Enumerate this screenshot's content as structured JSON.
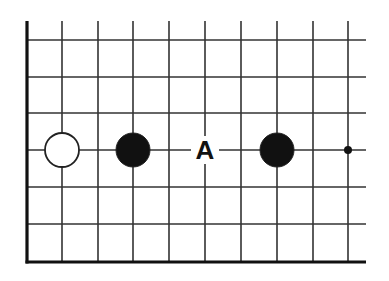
{
  "diagram": {
    "type": "go-board-fragment",
    "grid": {
      "x": [
        27,
        62,
        98,
        133,
        169,
        205,
        241,
        277,
        313,
        348
      ],
      "y": [
        40,
        77,
        113,
        150,
        187,
        224,
        262
      ],
      "top_open_y": 21,
      "right_open_x": 366,
      "edge_left_x": 27,
      "edge_bottom_y": 262,
      "line_color": "#333333",
      "edge_color": "#111111"
    },
    "stones": [
      {
        "color": "white",
        "col": 1,
        "row": 3
      },
      {
        "color": "black",
        "col": 3,
        "row": 3
      },
      {
        "color": "black",
        "col": 7,
        "row": 3
      }
    ],
    "star_points": [
      {
        "col": 9,
        "row": 3
      }
    ],
    "labels": [
      {
        "text": "A",
        "col": 5,
        "row": 3
      }
    ],
    "stone_radius": 17
  }
}
